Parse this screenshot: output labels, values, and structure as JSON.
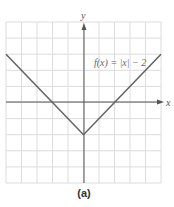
{
  "chart_data": {
    "type": "line",
    "title": "",
    "function_label": "f(x) = |x| − 2",
    "xlabel": "x",
    "ylabel": "y",
    "xlim": [
      -5,
      5
    ],
    "ylim": [
      -5,
      5
    ],
    "grid": true,
    "series": [
      {
        "name": "f(x) = |x| − 2",
        "x": [
          -5,
          -2,
          0,
          2,
          5
        ],
        "y": [
          3,
          0,
          -2,
          0,
          3
        ]
      }
    ],
    "caption": "(a)"
  },
  "colors": {
    "grid": "#dcdcdc",
    "axis": "#555555",
    "curve": "#666666",
    "text": "#666666"
  }
}
